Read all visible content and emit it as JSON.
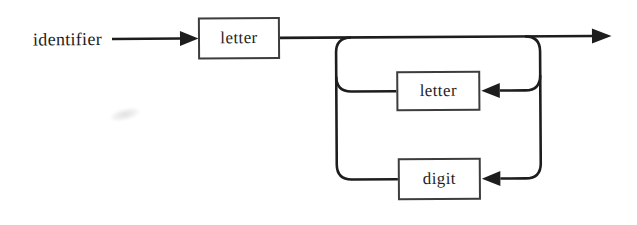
{
  "diagram": {
    "entry_label": "identifier",
    "boxes": [
      {
        "label": "letter"
      },
      {
        "label": "letter"
      },
      {
        "label": "digit"
      }
    ],
    "icons": {
      "arrowheads": [
        "entry-arrowhead-icon",
        "exit-arrowhead-icon",
        "letter-loop-arrowhead-icon",
        "digit-loop-arrowhead-icon"
      ]
    },
    "colors": {
      "line": "#1d1d1d",
      "box_border": "#3d3d3d",
      "box_fill": "#ffffff",
      "text": "#1f1f1f",
      "background": "#ffffff"
    }
  }
}
